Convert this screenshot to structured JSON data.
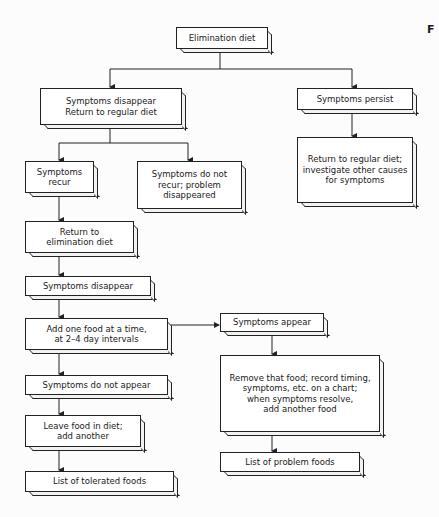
{
  "corner_label": "F",
  "nodes": {
    "elimination_diet": "Elimination diet",
    "symptoms_disappear_return": "Symptoms disappear\nReturn to regular diet",
    "symptoms_persist": "Symptoms persist",
    "return_regular_investigate": "Return to regular diet;\ninvestigate other causes\nfor symptoms",
    "symptoms_recur": "Symptoms\nrecur",
    "symptoms_do_not_recur": "Symptoms do not\nrecur; problem\ndisappeared",
    "return_to_elimination": "Return to\nelimination diet",
    "symptoms_disappear": "Symptoms disappear",
    "add_one_food": "Add one food at a time,\nat 2–4 day intervals",
    "symptoms_appear": "Symptoms appear",
    "remove_that_food": "Remove that food; record timing,\nsymptoms, etc. on a chart;\nwhen symptoms resolve,\nadd another food",
    "symptoms_do_not_appear": "Symptoms do not appear",
    "leave_food_in_diet": "Leave food in diet;\nadd another",
    "list_problem_foods": "List of problem foods",
    "list_tolerated_foods": "List of tolerated foods"
  }
}
